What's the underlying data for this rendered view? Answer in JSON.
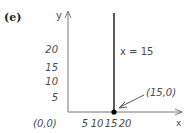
{
  "figure": {
    "panel_label": "(e)",
    "axes": {
      "x_label": "x",
      "y_label": "y",
      "origin_label": "(0,0)",
      "x_ticks": [
        "5",
        "10",
        "15",
        "20"
      ],
      "y_ticks": [
        "20",
        "15",
        "10",
        "5"
      ]
    },
    "line": {
      "label": "x = 15",
      "x_value": 15
    },
    "point": {
      "label": "(15,0)",
      "x": 15,
      "y": 0
    },
    "colors": {
      "axis": "#777777",
      "line": "#333333",
      "text": "#4a4a4a",
      "point": "#000000"
    }
  }
}
